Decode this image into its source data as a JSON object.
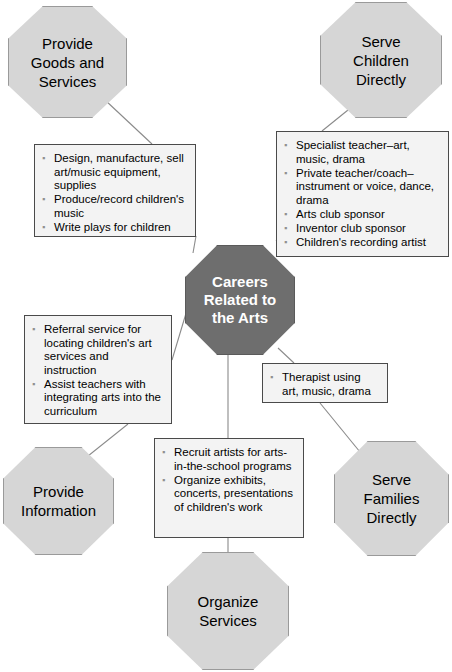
{
  "diagram": {
    "title": "Careers Related to the Arts",
    "type": "hub-and-spoke concept map",
    "colors": {
      "center_fill": "#6e6e6e",
      "center_text": "#ffffff",
      "octagon_fill": "#d6d6d6",
      "octagon_border": "#9a9a9a",
      "box_fill": "#f3f3f3",
      "box_border": "#4a4a4a",
      "bullet": "#8f8f8f",
      "connector": "#8a8a8a",
      "page_background": "#ffffff"
    },
    "center": {
      "label": "Careers\nRelated to\nthe Arts"
    },
    "categories": [
      {
        "id": "provide-goods-and-services",
        "label": "Provide\nGoods and\nServices",
        "items": [
          "Design, manufacture, sell art/music equipment, supplies",
          "Produce/record children's music",
          "Write plays for children"
        ]
      },
      {
        "id": "serve-children-directly",
        "label": "Serve\nChildren\nDirectly",
        "items": [
          "Specialist teacher–art, music, drama",
          "Private teacher/coach–instrument or voice, dance, drama",
          "Arts club sponsor",
          "Inventor club sponsor",
          "Children's recording artist"
        ]
      },
      {
        "id": "provide-information",
        "label": "Provide\nInformation",
        "items": [
          "Referral service for locating children's art services and instruction",
          "Assist teachers with integrating arts into the curriculum"
        ]
      },
      {
        "id": "serve-families-directly",
        "label": "Serve\nFamilies\nDirectly",
        "items": [
          "Therapist using art, music, drama"
        ]
      },
      {
        "id": "organize-services",
        "label": "Organize\nServices",
        "items": [
          "Recruit artists for arts-in-the-school programs",
          "Organize exhibits, concerts, presentations of children's work"
        ]
      }
    ]
  }
}
